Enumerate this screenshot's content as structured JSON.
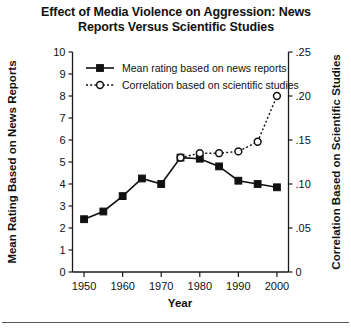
{
  "chart_data": {
    "type": "line",
    "title": "Effect of Media Violence on Aggression: News Reports Versus Scientific Studies",
    "title_line1": "Effect of Media Violence on Aggression: News",
    "title_line2": "Reports Versus Scientific Studies",
    "xlabel": "Year",
    "ylabel": "Mean Rating Based on News Reports",
    "y2label": "Correlation Based on Scientific Studies",
    "xlim": [
      1947,
      2003
    ],
    "ylim": [
      0,
      10
    ],
    "y2lim": [
      0,
      0.25
    ],
    "grid": false,
    "legend_position": "top-left-inside",
    "xticks": [
      1950,
      1960,
      1970,
      1980,
      1990,
      2000
    ],
    "xticklabels": [
      "1950",
      "1960",
      "1970",
      "1980",
      "1990",
      "2000"
    ],
    "yticks": [
      0,
      1,
      2,
      3,
      4,
      5,
      6,
      7,
      8,
      9,
      10
    ],
    "yticklabels": [
      "0",
      "1",
      "2",
      "3",
      "4",
      "5",
      "6",
      "7",
      "8",
      "9",
      "10"
    ],
    "y2ticks": [
      0,
      0.05,
      0.1,
      0.15,
      0.2,
      0.25
    ],
    "y2ticklabels": [
      "0",
      ".05",
      ".10",
      ".15",
      ".20",
      ".25"
    ],
    "series": [
      {
        "name": "Mean rating based on news reports",
        "axis": "left",
        "marker": "filled-square",
        "linestyle": "solid",
        "color": "#111111",
        "x": [
          1950,
          1955,
          1960,
          1965,
          1970,
          1975,
          1980,
          1985,
          1990,
          1995,
          2000
        ],
        "values": [
          2.4,
          2.75,
          3.45,
          4.25,
          4.0,
          5.2,
          5.15,
          4.8,
          4.15,
          4.0,
          3.85
        ]
      },
      {
        "name": "Correlation based on scientific studies",
        "axis": "right",
        "marker": "open-circle",
        "linestyle": "dotted",
        "color": "#111111",
        "x": [
          1975,
          1980,
          1985,
          1990,
          1995,
          2000
        ],
        "values": [
          0.13,
          0.135,
          0.135,
          0.137,
          0.148,
          0.2
        ]
      }
    ]
  },
  "legend": {
    "items": [
      {
        "label": "Mean rating based on news reports",
        "marker": "filled-square",
        "linestyle": "solid"
      },
      {
        "label": "Correlation based on scientific studies",
        "marker": "open-circle",
        "linestyle": "dotted"
      }
    ]
  }
}
